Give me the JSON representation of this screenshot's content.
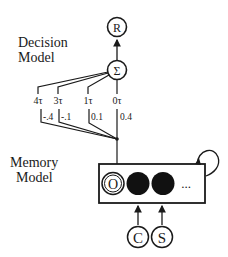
{
  "decision_model": {
    "title_line1": "Decision",
    "title_line2": "Model",
    "response_node": "R",
    "sum_node": "Σ",
    "delays": [
      {
        "label": "4τ",
        "weight": "-.4"
      },
      {
        "label": "3τ",
        "weight": "-.1"
      },
      {
        "label": "1τ",
        "weight": "0.1"
      },
      {
        "label": "0τ",
        "weight": "0.4"
      }
    ]
  },
  "memory_model": {
    "title_line1": "Memory",
    "title_line2": "Model",
    "slots": [
      "O",
      "",
      ""
    ],
    "ellipsis": "...",
    "inputs": [
      "C",
      "S"
    ]
  },
  "colors": {
    "stroke": "#1a1a1a",
    "fill": "#111111",
    "background": "#ffffff"
  }
}
